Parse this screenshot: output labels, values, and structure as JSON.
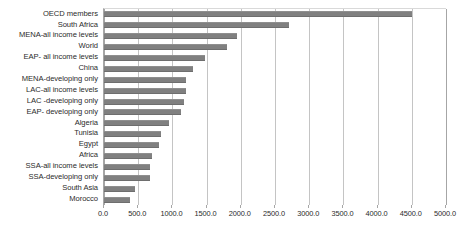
{
  "chart_data": {
    "type": "bar",
    "orientation": "horizontal",
    "title": "",
    "xlabel": "",
    "ylabel": "",
    "xlim": [
      0,
      5000
    ],
    "xticks": [
      "0.0",
      "500.0",
      "1000.0",
      "1500.0",
      "2000.0",
      "2500.0",
      "3000.0",
      "3500.0",
      "4000.0",
      "4500.0",
      "5000.0"
    ],
    "xtick_step": 500,
    "grid": true,
    "legend": "none",
    "categories": [
      "OECD members",
      "South Africa",
      "MENA-all income levels",
      "World",
      "EAP- all income levels",
      "China",
      "MENA-developing only",
      "LAC-all income levels",
      "LAC -developing only",
      "EAP- developing only",
      "Algeria",
      "Tunisia",
      "Egypt",
      "Africa",
      "SSA-all income levels",
      "SSA-developing only",
      "South Asia",
      "Morocco"
    ],
    "values": [
      4500,
      2700,
      1950,
      1800,
      1470,
      1300,
      1200,
      1200,
      1170,
      1130,
      950,
      830,
      800,
      700,
      670,
      670,
      450,
      380
    ],
    "colors": {
      "bar": "#808080",
      "gridline": "#c4c4c4",
      "axis": "#a6a6a6",
      "text": "#2b2b2b",
      "background": "#ffffff"
    }
  }
}
